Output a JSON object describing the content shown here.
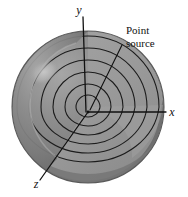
{
  "figure": {
    "title_visible": false,
    "background_color": "#ffffff",
    "line_color": "#111111"
  },
  "axes": {
    "x": {
      "label": "x",
      "label_x": 172,
      "label_y": 116,
      "tip_x": 166,
      "tip_y": 112,
      "origin_x": 88,
      "origin_y": 112
    },
    "y": {
      "label": "y",
      "label_x": 79,
      "label_y": 14,
      "tip_x": 83,
      "tip_y": 19,
      "origin_x": 88,
      "origin_y": 112
    },
    "z": {
      "label": "z",
      "label_x": 36,
      "label_y": 186,
      "tip_x": 41,
      "tip_y": 178,
      "origin_x": 88,
      "origin_y": 112
    }
  },
  "callout": {
    "line1": "Point",
    "line2": "source",
    "line1_x": 126,
    "line1_y": 34,
    "line2_x": 126,
    "line2_y": 47,
    "leader_from_x": 122,
    "leader_from_y": 44,
    "leader_to_x": 89,
    "leader_to_y": 111
  },
  "sphere": {
    "center_x": 88,
    "center_y": 107,
    "radius": 76,
    "outer_fill": "#7c7c7c",
    "outer_fill_light": "#8e8e8e",
    "cut_fill": "#9c9c9c",
    "cut_fill_shadow": "#8a8a8a",
    "highlight_fill": "#b9b9b9",
    "highlight_cx": 44,
    "highlight_cy": 72,
    "highlight_rx": 15,
    "highlight_ry": 11,
    "outline_color": "#4a4a4a"
  },
  "wavefronts": {
    "count": 6,
    "stroke": "#1a1a1a",
    "stroke_width": 1.1,
    "radii": [
      12,
      23,
      35,
      47,
      59,
      71
    ],
    "label": "concentric spherical wavefront shells"
  }
}
